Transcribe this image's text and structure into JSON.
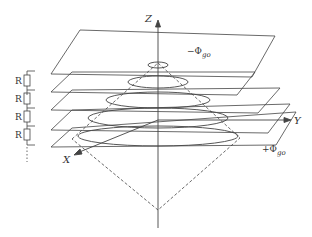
{
  "diagram": {
    "type": "stacked-electrode-planes-with-cone",
    "axes": {
      "z_label": "Z",
      "y_label": "Y",
      "x_label": "X"
    },
    "potentials": {
      "top_symbol": "−Φ",
      "top_subscript": "go",
      "bottom_symbol": "+Φ",
      "bottom_subscript": "go"
    },
    "resistors": [
      {
        "label": "R"
      },
      {
        "label": "R"
      },
      {
        "label": "R"
      },
      {
        "label": "R"
      }
    ],
    "plane_count": 5,
    "ellipse_count": 5,
    "colors": {
      "line": "#444444",
      "text": "#333333",
      "background": "#ffffff"
    }
  }
}
